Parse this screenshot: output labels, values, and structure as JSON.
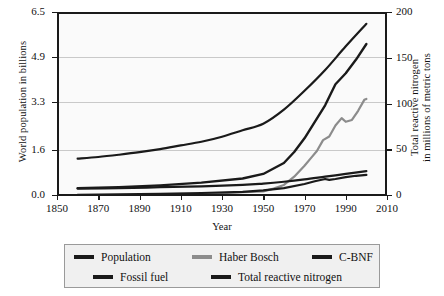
{
  "chart_data": {
    "type": "line",
    "title": "",
    "xlabel": "Year",
    "ylabel_left": "World population in billions",
    "ylabel_right": "Total reactive nitrogen in millions of metric tons",
    "ylabel_right_line1": "Total reactive nitrogen",
    "ylabel_right_line2": "in millions of metric tons",
    "xlim": [
      1850,
      2010
    ],
    "ylim_left": [
      0.0,
      6.5
    ],
    "ylim_right": [
      0,
      200
    ],
    "xticks": [
      1850,
      1870,
      1890,
      1910,
      1930,
      1950,
      1970,
      1990,
      2010
    ],
    "yticks_left": [
      "0.0",
      "1.6",
      "3.3",
      "4.9",
      "6.5"
    ],
    "yticks_left_values": [
      0.0,
      1.6,
      3.3,
      4.9,
      6.5
    ],
    "yticks_right": [
      "0",
      "50",
      "100",
      "150",
      "200"
    ],
    "yticks_right_values": [
      0,
      50,
      100,
      150,
      200
    ],
    "grid": "horizontal",
    "legend_position": "below-plot",
    "plot_bgcolor": "#fafafa",
    "gridline_color": "#c9c9c9",
    "axis_color": "#1a1a1a",
    "series": [
      {
        "name": "Population",
        "axis": "left",
        "color": "#1a1a1a",
        "width": 2.2,
        "x": [
          1860,
          1870,
          1880,
          1890,
          1900,
          1910,
          1920,
          1930,
          1940,
          1950,
          1960,
          1970,
          1980,
          1990,
          2000
        ],
        "values": [
          1.29,
          1.35,
          1.43,
          1.52,
          1.63,
          1.76,
          1.89,
          2.07,
          2.3,
          2.53,
          3.03,
          3.7,
          4.44,
          5.28,
          6.08
        ]
      },
      {
        "name": "Haber Bosch",
        "axis": "right",
        "color": "#8c8c8c",
        "width": 2.2,
        "x": [
          1913,
          1920,
          1930,
          1940,
          1950,
          1955,
          1960,
          1965,
          1970,
          1973,
          1976,
          1979,
          1982,
          1985,
          1988,
          1990,
          1993,
          1996,
          1999,
          2000
        ],
        "values": [
          0.5,
          1.0,
          2.0,
          3.0,
          4.0,
          7.0,
          11.0,
          20.0,
          32.0,
          40.0,
          48.0,
          60.0,
          64.0,
          76.0,
          84.0,
          80.0,
          82.0,
          92.0,
          104.0,
          105.0
        ]
      },
      {
        "name": "C-BNF",
        "axis": "right",
        "color": "#1a1a1a",
        "width": 2.2,
        "x": [
          1860,
          1880,
          1900,
          1920,
          1940,
          1950,
          1960,
          1970,
          1980,
          1990,
          2000
        ],
        "values": [
          7.0,
          7.5,
          8.5,
          9.5,
          11.0,
          12.5,
          14.5,
          17.0,
          20.0,
          23.0,
          26.0
        ]
      },
      {
        "name": "Fossil fuel",
        "axis": "right",
        "color": "#1a1a1a",
        "width": 2.2,
        "x": [
          1860,
          1880,
          1900,
          1920,
          1940,
          1950,
          1960,
          1970,
          1975,
          1980,
          1982,
          1985,
          1990,
          1995,
          2000
        ],
        "values": [
          0.3,
          0.6,
          1.2,
          2.2,
          3.5,
          5.0,
          7.5,
          12.0,
          15.0,
          17.5,
          16.5,
          17.5,
          19.5,
          21.0,
          22.0
        ]
      },
      {
        "name": "Total reactive nitrogen",
        "axis": "right",
        "color": "#1a1a1a",
        "width": 2.4,
        "x": [
          1860,
          1880,
          1900,
          1920,
          1940,
          1950,
          1960,
          1965,
          1970,
          1975,
          1980,
          1985,
          1990,
          1995,
          2000
        ],
        "values": [
          7.5,
          8.5,
          10.5,
          13.5,
          18.0,
          23.0,
          35.0,
          47.0,
          62.0,
          80.0,
          98.0,
          121.0,
          133.0,
          148.0,
          165.0
        ]
      }
    ]
  },
  "legend": {
    "rows": [
      [
        {
          "label": "Population",
          "color": "#1a1a1a"
        },
        {
          "label": "Haber Bosch",
          "color": "#8c8c8c"
        },
        {
          "label": "C-BNF",
          "color": "#1a1a1a"
        }
      ],
      [
        {
          "label": "Fossil fuel",
          "color": "#1a1a1a"
        },
        {
          "label": "Total reactive nitrogen",
          "color": "#1a1a1a"
        }
      ]
    ]
  }
}
